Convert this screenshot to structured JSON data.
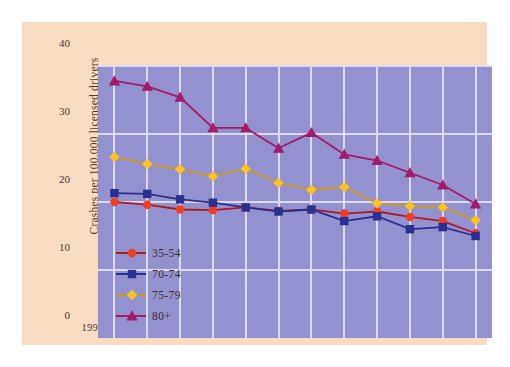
{
  "chart_data": {
    "type": "line",
    "title": "",
    "xlabel": "",
    "ylabel": "Crashes per 100,000 licensed drivers",
    "categories": [
      "1997",
      "1998",
      "1999",
      "2000",
      "2001",
      "2002",
      "2003",
      "2004",
      "2005",
      "2006",
      "2007",
      "2008"
    ],
    "ylim": [
      0,
      40
    ],
    "yticks": [
      0,
      10,
      20,
      30,
      40
    ],
    "ytick_labels": [
      "0",
      "10",
      "20",
      "30",
      "40"
    ],
    "grid": true,
    "legend_position": "inside-lower-left",
    "series": [
      {
        "name": "35-54",
        "color": "#ef3e24",
        "line_color": "#a81d1d",
        "marker": "circle",
        "values": [
          20.0,
          19.6,
          18.9,
          18.8,
          19.2,
          18.7,
          18.9,
          18.3,
          18.6,
          17.8,
          17.2,
          15.4
        ]
      },
      {
        "name": "70-74",
        "color": "#2b2f8f",
        "line_color": "#2b2f8f",
        "marker": "square",
        "values": [
          21.3,
          21.2,
          20.4,
          19.9,
          19.2,
          18.6,
          18.9,
          17.2,
          17.9,
          16.0,
          16.3,
          15.0
        ]
      },
      {
        "name": "75-79",
        "color": "#f7c325",
        "line_color": "#c79a1e",
        "marker": "diamond",
        "values": [
          26.6,
          25.6,
          24.8,
          23.8,
          24.9,
          22.8,
          21.8,
          22.2,
          19.8,
          19.4,
          19.2,
          17.3
        ]
      },
      {
        "name": "80+",
        "color": "#a21a6a",
        "line_color": "#a21a6a",
        "marker": "triangle",
        "values": [
          37.8,
          37.0,
          35.4,
          30.9,
          30.9,
          27.9,
          30.2,
          27.0,
          26.1,
          24.3,
          22.5,
          19.7
        ]
      }
    ]
  },
  "legend": {
    "items": [
      {
        "label": "35-54"
      },
      {
        "label": "70-74"
      },
      {
        "label": "75-79"
      },
      {
        "label": "80+"
      }
    ]
  },
  "theme": {
    "page_background": "#ffffff",
    "panel_background": "#f6dcc2",
    "plot_background": "#9391cf",
    "grid_color": "#ddddf0",
    "text_color": "#4b3b2e"
  }
}
